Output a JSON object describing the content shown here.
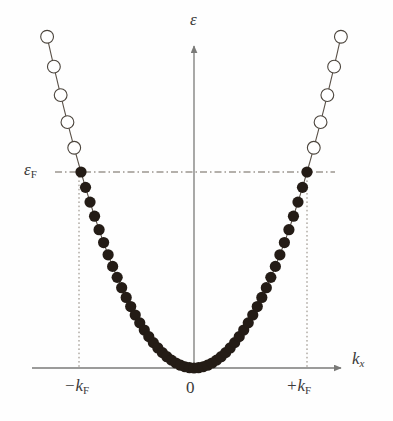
{
  "figure": {
    "background_color": "#fefefe",
    "width": 393,
    "height": 421
  },
  "labels": {
    "y_axis": "ε",
    "x_axis_base": "k",
    "x_axis_sub": "x",
    "fermi_base": "ε",
    "fermi_sub": "F",
    "kf_negative_base": "−k",
    "kf_negative_sub": "F",
    "kf_positive_base": "+k",
    "kf_positive_sub": "F",
    "origin": "0"
  },
  "colors": {
    "axis": "#7a7a78",
    "curve": "#5a5148",
    "filled_marker": "#241c16",
    "open_marker_stroke": "#4b443c",
    "open_marker_fill": "#ffffff",
    "fermi_dash": "#6b6258",
    "guide_dot": "#8a8278",
    "text": "#3a3a3a"
  },
  "geometry": {
    "origin_x": 194,
    "axis_y": 368,
    "y_axis_top": 45,
    "x_axis_left": 32,
    "x_axis_right": 342,
    "fermi_y": 172,
    "fermi_line_left": 55,
    "fermi_line_right": 335,
    "kf_negative_x": 79,
    "kf_positive_x": 307,
    "curve_top_left_x": 45,
    "curve_top_right_x": 340,
    "curve_top_y": 38
  },
  "chart_data": {
    "type": "scatter",
    "title": "",
    "xlabel": "k_x",
    "ylabel": "ε",
    "grid": false,
    "legend": null,
    "annotations": [
      {
        "text": "ε",
        "role": "y-axis-label"
      },
      {
        "text": "k_x",
        "role": "x-axis-label"
      },
      {
        "text": "ε_F",
        "role": "fermi-energy-level"
      },
      {
        "text": "−k_F",
        "role": "negative-fermi-wavevector"
      },
      {
        "text": "0",
        "role": "origin"
      },
      {
        "text": "+k_F",
        "role": "positive-fermi-wavevector"
      }
    ],
    "axis_ranges": {
      "x": [
        -1.45,
        1.45
      ],
      "y": [
        0,
        2.1
      ]
    },
    "reference_lines": [
      {
        "name": "fermi-level",
        "orientation": "horizontal",
        "value": 1.0,
        "style": "dash-dot"
      },
      {
        "name": "kf-negative-guide",
        "orientation": "vertical",
        "value": -1.0,
        "style": "dotted"
      },
      {
        "name": "kf-positive-guide",
        "orientation": "vertical",
        "value": 1.0,
        "style": "dotted"
      }
    ],
    "curve": {
      "formula": "epsilon = k^2",
      "k_fermi": 1.0,
      "epsilon_fermi": 1.0
    },
    "series": [
      {
        "name": "occupied states",
        "marker": "filled-circle",
        "k": [
          -1.0,
          -0.96,
          -0.92,
          -0.88,
          -0.84,
          -0.8,
          -0.76,
          -0.72,
          -0.68,
          -0.64,
          -0.6,
          -0.56,
          -0.52,
          -0.48,
          -0.44,
          -0.4,
          -0.36,
          -0.32,
          -0.28,
          -0.24,
          -0.2,
          -0.16,
          -0.12,
          -0.08,
          -0.04,
          0.0,
          0.04,
          0.08,
          0.12,
          0.16,
          0.2,
          0.24,
          0.28,
          0.32,
          0.36,
          0.4,
          0.44,
          0.48,
          0.52,
          0.56,
          0.6,
          0.64,
          0.68,
          0.72,
          0.76,
          0.8,
          0.84,
          0.88,
          0.92,
          0.96,
          1.0
        ],
        "epsilon": [
          1.0,
          0.9216,
          0.8464,
          0.7744,
          0.7056,
          0.64,
          0.5776,
          0.5184,
          0.4624,
          0.4096,
          0.36,
          0.3136,
          0.2704,
          0.2304,
          0.1936,
          0.16,
          0.1296,
          0.1024,
          0.0784,
          0.0576,
          0.04,
          0.0256,
          0.0144,
          0.0064,
          0.0016,
          0.0,
          0.0016,
          0.0064,
          0.0144,
          0.0256,
          0.04,
          0.0576,
          0.0784,
          0.1024,
          0.1296,
          0.16,
          0.1936,
          0.2304,
          0.2704,
          0.3136,
          0.36,
          0.4096,
          0.4624,
          0.5184,
          0.5776,
          0.64,
          0.7056,
          0.7744,
          0.8464,
          0.9216,
          1.0
        ]
      },
      {
        "name": "unoccupied states",
        "marker": "open-circle",
        "k": [
          -1.3,
          -1.24,
          -1.18,
          -1.12,
          -1.06,
          1.06,
          1.12,
          1.18,
          1.24,
          1.3
        ],
        "epsilon": [
          1.69,
          1.5376,
          1.3924,
          1.2544,
          1.1236,
          1.1236,
          1.2544,
          1.3924,
          1.5376,
          1.69
        ]
      }
    ]
  }
}
